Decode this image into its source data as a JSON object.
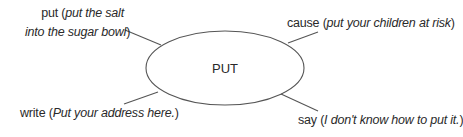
{
  "center": {
    "label": "PUT"
  },
  "branches": [
    {
      "id": "top-left",
      "word": "put",
      "example_line1": "put the salt",
      "example_line2": "into the sugar bowl"
    },
    {
      "id": "top-right",
      "word": "cause",
      "example": "put your children at risk"
    },
    {
      "id": "bottom-left",
      "word": "write",
      "example": "Put your address here."
    },
    {
      "id": "bottom-right",
      "word": "say",
      "example": "I don't know how to put it."
    }
  ],
  "colors": {
    "line": "#555555",
    "text": "#2a2a2a"
  }
}
